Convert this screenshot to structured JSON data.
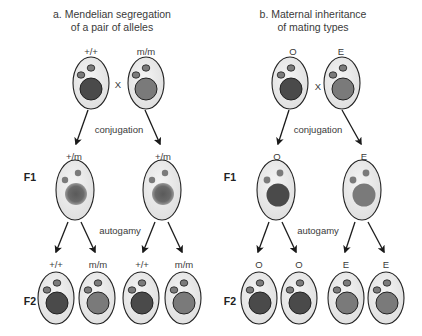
{
  "colors": {
    "cell_fill": "#ececec",
    "cell_stroke": "#222222",
    "macro_dark": "#4a4a4a",
    "macro_light": "#7a7a7a",
    "macro_f1_a": "#6a6a6a",
    "micro": "#7b7b7b",
    "arrow": "#1a1a1a"
  },
  "panels": [
    {
      "id": "a",
      "title_line1": "a. Mendelian segregation",
      "title_line2": "of a pair of alleles",
      "parents": [
        {
          "label": "+/+",
          "macro": "dark"
        },
        {
          "label": "m/m",
          "macro": "light"
        }
      ],
      "cross_symbol": "X",
      "process_1": "conjugation",
      "f1_label": "F1",
      "f1": [
        {
          "label": "+/m",
          "macro": "blurred"
        },
        {
          "label": "+/m",
          "macro": "blurred"
        }
      ],
      "process_2": "autogamy",
      "f2_label": "F2",
      "f2": [
        {
          "label": "+/+",
          "macro": "dark"
        },
        {
          "label": "m/m",
          "macro": "light"
        },
        {
          "label": "+/+",
          "macro": "dark"
        },
        {
          "label": "m/m",
          "macro": "light"
        }
      ]
    },
    {
      "id": "b",
      "title_line1": "b. Maternal inheritance",
      "title_line2": "of mating types",
      "parents": [
        {
          "label": "O",
          "macro": "dark"
        },
        {
          "label": "E",
          "macro": "light"
        }
      ],
      "cross_symbol": "X",
      "process_1": "conjugation",
      "f1_label": "F1",
      "f1": [
        {
          "label": "O",
          "macro": "dark"
        },
        {
          "label": "E",
          "macro": "light"
        }
      ],
      "process_2": "autogamy",
      "f2_label": "F2",
      "f2": [
        {
          "label": "O",
          "macro": "dark"
        },
        {
          "label": "O",
          "macro": "dark"
        },
        {
          "label": "E",
          "macro": "light"
        },
        {
          "label": "E",
          "macro": "light"
        }
      ]
    }
  ]
}
